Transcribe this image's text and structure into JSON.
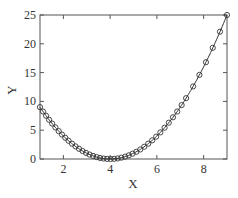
{
  "chart_data": {
    "type": "line",
    "title": "",
    "xlabel": "X",
    "ylabel": "Y",
    "xlim": [
      1,
      9
    ],
    "ylim": [
      0,
      25
    ],
    "x_ticks": [
      2,
      4,
      6,
      8
    ],
    "y_ticks": [
      0,
      5,
      10,
      15,
      20,
      25
    ],
    "grid": false,
    "legend": null,
    "series": [
      {
        "name": "fit curve",
        "style": "solid line",
        "function": "y = (x - 4)^2",
        "x": [
          1,
          1.5,
          2,
          2.5,
          3,
          3.5,
          4,
          4.5,
          5,
          5.5,
          6,
          6.5,
          7,
          7.5,
          8,
          8.5,
          9
        ],
        "values": [
          9,
          6.25,
          4,
          2.25,
          1,
          0.25,
          0,
          0.25,
          1,
          2.25,
          4,
          6.25,
          9,
          12.25,
          16,
          20.25,
          25
        ]
      },
      {
        "name": "data points",
        "style": "open circle markers",
        "x": [
          1.0,
          1.13,
          1.26,
          1.39,
          1.52,
          1.66,
          1.8,
          1.94,
          2.08,
          2.22,
          2.37,
          2.52,
          2.67,
          2.82,
          2.97,
          3.12,
          3.27,
          3.42,
          3.57,
          3.72,
          3.87,
          4.02,
          4.17,
          4.32,
          4.48,
          4.64,
          4.8,
          4.96,
          5.12,
          5.29,
          5.46,
          5.63,
          5.8,
          5.97,
          6.15,
          6.33,
          6.51,
          6.69,
          6.87,
          7.06,
          7.25,
          7.55,
          7.82,
          8.1,
          8.39,
          8.7,
          9.0
        ],
        "values": [
          9.0,
          8.24,
          7.51,
          6.81,
          6.15,
          5.48,
          4.84,
          4.24,
          3.69,
          3.17,
          2.66,
          2.19,
          1.77,
          1.39,
          1.06,
          0.77,
          0.53,
          0.34,
          0.18,
          0.08,
          0.02,
          0.0,
          0.03,
          0.1,
          0.23,
          0.41,
          0.64,
          0.92,
          1.25,
          1.66,
          2.13,
          2.66,
          3.24,
          3.88,
          4.62,
          5.43,
          6.3,
          7.24,
          8.24,
          9.36,
          10.56,
          12.6,
          14.6,
          16.8,
          19.3,
          22.1,
          25.0
        ]
      }
    ]
  },
  "axes": {
    "x_tick_labels": [
      "2",
      "4",
      "6",
      "8"
    ],
    "y_tick_labels": [
      "0",
      "5",
      "10",
      "15",
      "20",
      "25"
    ],
    "xlabel": "X",
    "ylabel": "Y"
  },
  "colors": {
    "axis": "#555555",
    "line": "#333333",
    "marker": "#333333",
    "background": "#ffffff"
  }
}
